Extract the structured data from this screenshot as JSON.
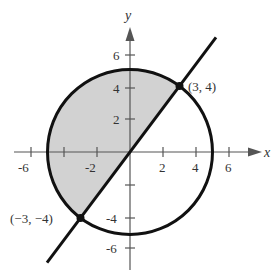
{
  "diagram": {
    "type": "graph-region",
    "axes": {
      "x_label": "x",
      "y_label": "y",
      "x_ticks": [
        "-6",
        "-2",
        "2",
        "4",
        "6"
      ],
      "x_tick_marks": [
        -6,
        -4,
        -2,
        2,
        4,
        6
      ],
      "y_ticks": [
        "6",
        "4",
        "2",
        "-4",
        "-6"
      ],
      "y_tick_marks": [
        6,
        4,
        2,
        -2,
        -4,
        -6
      ]
    },
    "circle": {
      "center": [
        0,
        0
      ],
      "radius": 5
    },
    "line": {
      "slope": 1.3333,
      "intercept": 0
    },
    "points": [
      {
        "label": "(3, 4)",
        "x": 3,
        "y": 4
      },
      {
        "label": "(−3, −4)",
        "x": -3,
        "y": -4
      }
    ],
    "shading": {
      "color": "#d4d4d4",
      "region": "inside circle, above/left of line"
    },
    "colors": {
      "curve": "#111111",
      "axis": "#555555",
      "shade": "#d4d4d4"
    }
  }
}
